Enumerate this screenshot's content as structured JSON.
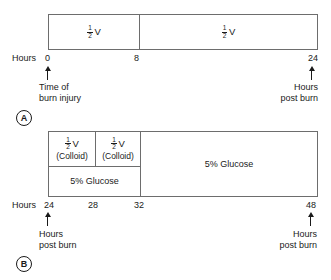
{
  "figure": {
    "line_color": "#6d6d6d",
    "text_color": "#1a1a1a",
    "background": "#ffffff"
  },
  "panel_a": {
    "letter": "A",
    "hours_label": "Hours",
    "segments": [
      {
        "name": "half-volume-first-8-hours",
        "numerator": "1",
        "denominator": "2",
        "unit": "V",
        "sub": ""
      },
      {
        "name": "half-volume-next-16-hours",
        "numerator": "1",
        "denominator": "2",
        "unit": "V",
        "sub": ""
      }
    ],
    "ticks": [
      "0",
      "8",
      "24"
    ],
    "left_caption_line1": "Time of",
    "left_caption_line2": "burn injury",
    "right_caption_line1": "Hours",
    "right_caption_line2": "post burn"
  },
  "panel_b": {
    "letter": "B",
    "hours_label": "Hours",
    "top_segments": [
      {
        "name": "half-volume-colloid-24-28",
        "numerator": "1",
        "denominator": "2",
        "unit": "V",
        "sub": "(Colloid)"
      },
      {
        "name": "half-volume-colloid-28-32",
        "numerator": "1",
        "denominator": "2",
        "unit": "V",
        "sub": "(Colloid)"
      }
    ],
    "bottom_segment": {
      "name": "glucose-24-32",
      "label": "5% Glucose"
    },
    "right_segment": {
      "name": "glucose-32-48",
      "label": "5% Glucose"
    },
    "ticks": [
      "24",
      "28",
      "32",
      "48"
    ],
    "left_caption_line1": "Hours",
    "left_caption_line2": "post burn",
    "right_caption_line1": "Hours",
    "right_caption_line2": "post burn"
  }
}
